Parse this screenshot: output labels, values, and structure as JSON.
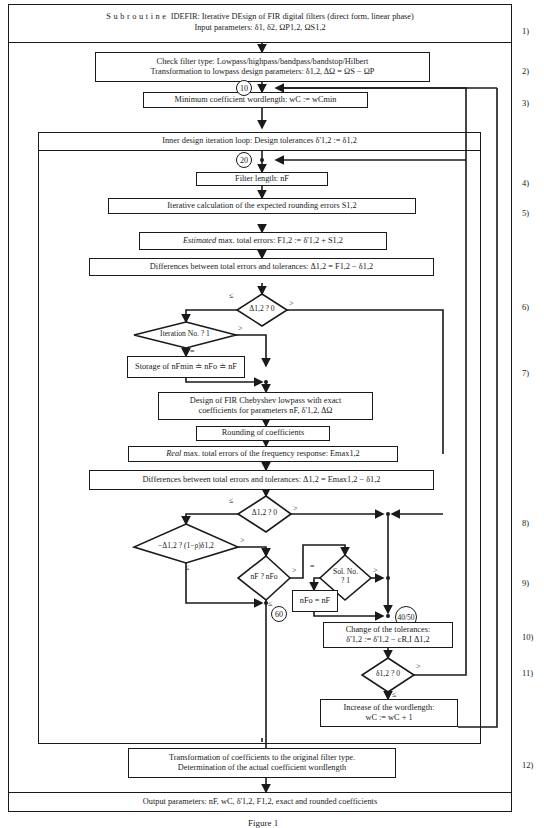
{
  "header": {
    "line1_prefix": "Subroutine",
    "line1_rest": "IDEFIR: Iterative DEsign of FIR digital filters (direct form, linear phase)",
    "line2": "Input parameters: δ1, δ2, ΩP1,2, ΩS1,2"
  },
  "steps": {
    "s2_line1": "Check filter type: Lowpass/highpass/bandpass/bandstop/Hilbert",
    "s2_line2": "Transformation to lowpass design parameters: δ1,2, ΔΩ = ΩS − ΩP",
    "s3": "Minimum coefficient wordlength: wC := wCmin",
    "inner_loop": "Inner design iteration loop: Design tolerances δ'1,2 := δ1,2",
    "s4": "Filter length: nF",
    "s5": "Iterative calculation of the expected rounding errors S1,2",
    "estimated_em": "Estimated",
    "estimated_rest": " max. total errors: F1,2 := δ'1,2 + S1,2",
    "diff1": "Differences between total errors and tolerances: Δ1,2 = F1,2 − δ1,2",
    "d6": "Δ1,2 ? 0",
    "d_iter": "Iteration No. ? 1",
    "storage": "Storage of nFmin ≐ nFo ≐ nF",
    "design_line1": "Design of FIR Chebyshev lowpass with exact",
    "design_line2": "coefficients for parameters nF, δ'1,2, ΔΩ",
    "rounding": "Rounding of coefficients",
    "real_em": "Real",
    "real_rest": " max. total errors of the frequency response: Emax1,2",
    "diff2": "Differences between total errors and tolerances: Δ1,2 = Emax1,2 − δ1,2",
    "d8": "Δ1,2 ? 0",
    "d_rho": "−Δ1,2 ? (1−ρ)δ1,2",
    "d_nf": "nF ? nFo",
    "d_sol_line1": "Sol. No.",
    "d_sol_line2": "? 1",
    "nfo_assign": "nFo = nF",
    "change_line1": "Change of the tolerances:",
    "change_line2": "δ'1,2 := δ'1,2 − cR,I Δ1,2",
    "d11": "δ1,2 ? 0",
    "increase_line1": "Increase of the wordlength:",
    "increase_line2": "wC := wC + 1",
    "s12_line1": "Transformation of coefficients to the original filter type.",
    "s12_line2": "Determination of the actual coefficient wordlength",
    "output": "Output parameters: nF, wC, δ'1,2, F1,2, exact and rounded coefficients"
  },
  "connectors": {
    "c10": "10",
    "c20": "20",
    "c60": "60",
    "c4050": "40/50"
  },
  "branch_labels": {
    "le": "≤",
    "gt": ">",
    "eq": "="
  },
  "step_numbers": [
    "1)",
    "2)",
    "3)",
    "4)",
    "5)",
    "6)",
    "7)",
    "8)",
    "9)",
    "10)",
    "11)",
    "12)"
  ],
  "caption": "Figure 1"
}
